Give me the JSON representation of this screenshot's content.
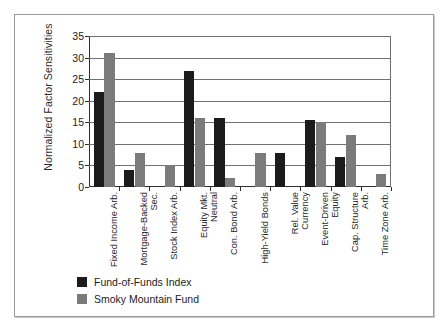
{
  "chart_data": {
    "type": "bar",
    "title": "",
    "xlabel": "",
    "ylabel": "Normalized Factor Sensitivities",
    "ylim": [
      0,
      35
    ],
    "yticks": [
      0,
      5,
      10,
      15,
      20,
      25,
      30,
      35
    ],
    "grid": true,
    "legend_position": "below-left",
    "categories": [
      "Fixed Income Arb.",
      "Mortgage-Backed Sec.",
      "Stock Index Arb.",
      "Equity Mkt. Neutral",
      "Con. Bond Arb.",
      "High-Yield Bonds",
      "Rel. Value Currency",
      "Event-Driven Equity",
      "Cap. Structure Arb.",
      "Time Zone Arb."
    ],
    "series": [
      {
        "name": "Fund-of-Funds Index",
        "color": "#1b1b1b",
        "values": [
          22,
          4,
          0,
          27,
          16,
          0,
          8,
          15.5,
          7,
          0
        ]
      },
      {
        "name": "Smoky Mountain Fund",
        "color": "#7b7b7b",
        "values": [
          31,
          8,
          5,
          16,
          2,
          8,
          0,
          15,
          12,
          3
        ]
      }
    ]
  }
}
